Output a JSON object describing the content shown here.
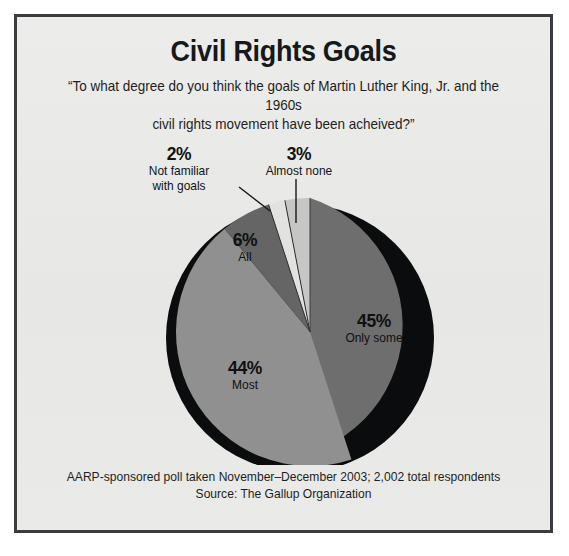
{
  "poster": {
    "title": "Civil Rights Goals",
    "subtitle_line1": "“To what degree do you think the goals of Martin Luther King, Jr. and the 1960s",
    "subtitle_line2": "civil rights movement have been acheived?”",
    "footer_line1": "AARP-sponsored poll taken November–December 2003; 2,002 total respondents",
    "footer_line2": "Source: The Gallup Organization",
    "frame_color": "#3a3c40",
    "background_color": "#e9e9e7"
  },
  "callouts": {
    "not_familiar": {
      "pct": "2%",
      "name_line1": "Not familiar",
      "name_line2": "with goals"
    },
    "almost_none": {
      "pct": "3%",
      "name": "Almost none"
    },
    "all": {
      "pct": "6%",
      "name": "All"
    },
    "only_some": {
      "pct": "45%",
      "name": "Only some"
    },
    "most": {
      "pct": "44%",
      "name": "Most"
    }
  },
  "chart_data": {
    "type": "pie",
    "title": "Civil Rights Goals",
    "subtitle": "“To what degree do you think the goals of Martin Luther King, Jr. and the 1960s civil rights movement have been acheived?”",
    "labels": [
      "Only some",
      "Most",
      "All",
      "Not familiar with goals",
      "Almost none"
    ],
    "values": [
      45,
      44,
      6,
      2,
      3
    ],
    "value_labels": [
      "45%",
      "44%",
      "6%",
      "2%",
      "3%"
    ],
    "colors": [
      "#6e6e6e",
      "#909090",
      "#656565",
      "#e2e2e0",
      "#c6c6c4"
    ],
    "units": "percent",
    "start_angle_deg": 0,
    "direction": "clockwise",
    "total_respondents": "2,002",
    "legend": "none",
    "annotations": [
      "AARP-sponsored poll taken November–December 2003; 2,002 total respondents",
      "Source: The Gallup Organization"
    ]
  }
}
